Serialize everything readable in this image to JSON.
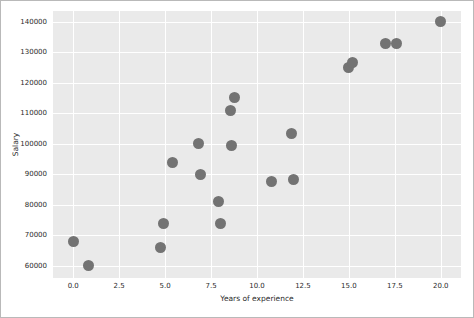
{
  "figure": {
    "background_color": "#ffffff",
    "border_color": "#b9b9b9"
  },
  "chart_data": {
    "type": "scatter",
    "title": "",
    "xlabel": "Years of experience",
    "ylabel": "Salary",
    "xlim": [
      -1.1,
      21.1
    ],
    "ylim": [
      56000,
      143500
    ],
    "xticks": [
      "0.0",
      "2.5",
      "5.0",
      "7.5",
      "10.0",
      "12.5",
      "15.0",
      "17.5",
      "20.0"
    ],
    "xtick_values": [
      0.0,
      2.5,
      5.0,
      7.5,
      10.0,
      12.5,
      15.0,
      17.5,
      20.0
    ],
    "yticks": [
      "60000",
      "70000",
      "80000",
      "90000",
      "100000",
      "110000",
      "120000",
      "130000",
      "140000"
    ],
    "ytick_values": [
      60000,
      70000,
      80000,
      90000,
      100000,
      110000,
      120000,
      130000,
      140000
    ],
    "grid": true,
    "grid_color": "#ffffff",
    "axes_background": "#eaeaea",
    "legend": null,
    "marker_color": "#737373",
    "marker_size": 11,
    "series": [
      {
        "name": "Salary vs Years of experience",
        "points": [
          {
            "x": 0.0,
            "y": 67800
          },
          {
            "x": 0.85,
            "y": 60000
          },
          {
            "x": 4.75,
            "y": 66000
          },
          {
            "x": 4.9,
            "y": 74000
          },
          {
            "x": 5.4,
            "y": 94000
          },
          {
            "x": 6.8,
            "y": 100000
          },
          {
            "x": 6.9,
            "y": 89800
          },
          {
            "x": 7.9,
            "y": 81000
          },
          {
            "x": 8.0,
            "y": 73800
          },
          {
            "x": 8.55,
            "y": 110800
          },
          {
            "x": 8.6,
            "y": 99500
          },
          {
            "x": 8.8,
            "y": 115200
          },
          {
            "x": 10.8,
            "y": 87700
          },
          {
            "x": 11.9,
            "y": 103200
          },
          {
            "x": 12.0,
            "y": 88200
          },
          {
            "x": 15.0,
            "y": 125000
          },
          {
            "x": 15.2,
            "y": 126500
          },
          {
            "x": 17.0,
            "y": 133000
          },
          {
            "x": 17.6,
            "y": 132700
          },
          {
            "x": 20.0,
            "y": 140000
          }
        ]
      }
    ]
  }
}
